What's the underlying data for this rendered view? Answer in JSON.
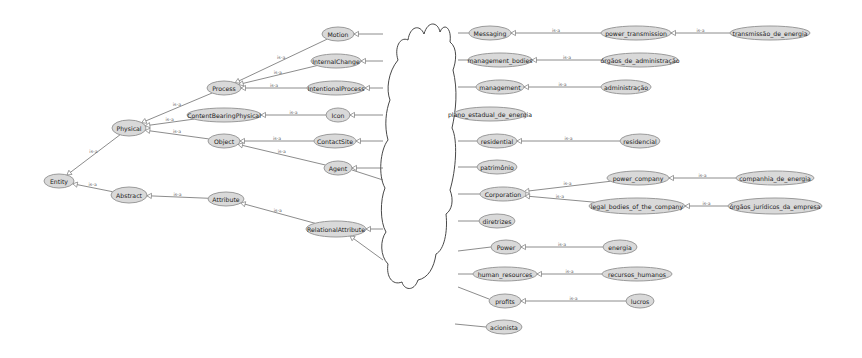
{
  "diagram": {
    "title": "",
    "edge_label": "is-a",
    "colors": {
      "node_fill": "#d9d9d9",
      "node_stroke": "#9a9a9a",
      "edge": "#6e6e6e",
      "background": "#ffffff"
    },
    "nodes": [
      {
        "id": "Entity",
        "label": "Entity",
        "x": 59,
        "y": 181,
        "rx": 15,
        "ry": 7
      },
      {
        "id": "Physical",
        "label": "Physical",
        "x": 129,
        "y": 128,
        "rx": 17,
        "ry": 8
      },
      {
        "id": "Abstract",
        "label": "Abstract",
        "x": 129,
        "y": 195,
        "rx": 18,
        "ry": 8
      },
      {
        "id": "Process",
        "label": "Process",
        "x": 224,
        "y": 88,
        "rx": 17,
        "ry": 7
      },
      {
        "id": "ContentBearingPhysical",
        "label": "ContentBearingPhysical",
        "x": 224,
        "y": 115,
        "rx": 37,
        "ry": 7
      },
      {
        "id": "Object",
        "label": "Object",
        "x": 224,
        "y": 141,
        "rx": 16,
        "ry": 7
      },
      {
        "id": "Attribute",
        "label": "Attribute",
        "x": 226,
        "y": 199,
        "rx": 18,
        "ry": 7
      },
      {
        "id": "Motion",
        "label": "Motion",
        "x": 338,
        "y": 34,
        "rx": 16,
        "ry": 7
      },
      {
        "id": "InternalChange",
        "label": "InternalChange",
        "x": 336,
        "y": 61,
        "rx": 25,
        "ry": 7
      },
      {
        "id": "IntentionalProcess",
        "label": "IntentionalProcess",
        "x": 336,
        "y": 88,
        "rx": 29,
        "ry": 7
      },
      {
        "id": "Icon",
        "label": "Icon",
        "x": 338,
        "y": 115,
        "rx": 12,
        "ry": 7
      },
      {
        "id": "ContactSite",
        "label": "ContactSite",
        "x": 335,
        "y": 141,
        "rx": 21,
        "ry": 7
      },
      {
        "id": "Agent",
        "label": "Agent",
        "x": 338,
        "y": 168,
        "rx": 14,
        "ry": 7
      },
      {
        "id": "RelationalAttribute",
        "label": "RelationalAttribute",
        "x": 336,
        "y": 229,
        "rx": 30,
        "ry": 8
      },
      {
        "id": "Messaging",
        "label": "Messaging",
        "x": 490,
        "y": 33,
        "rx": 21,
        "ry": 7
      },
      {
        "id": "management_bodies",
        "label": "management_bodies",
        "x": 500,
        "y": 60,
        "rx": 32,
        "ry": 7
      },
      {
        "id": "management",
        "label": "management",
        "x": 500,
        "y": 87,
        "rx": 24,
        "ry": 7
      },
      {
        "id": "plano_estadual_de_energia",
        "label": "plano_estadual_de_energia",
        "x": 490,
        "y": 114,
        "rx": 36,
        "ry": 7
      },
      {
        "id": "residential",
        "label": "residential",
        "x": 497,
        "y": 141,
        "rx": 20,
        "ry": 7
      },
      {
        "id": "patrimonio",
        "label": "patrimônio",
        "x": 497,
        "y": 167,
        "rx": 20,
        "ry": 7
      },
      {
        "id": "Corporation",
        "label": "Corporation",
        "x": 503,
        "y": 194,
        "rx": 23,
        "ry": 7
      },
      {
        "id": "diretrizes",
        "label": "diretrizes",
        "x": 497,
        "y": 221,
        "rx": 18,
        "ry": 7
      },
      {
        "id": "Power",
        "label": "Power",
        "x": 506,
        "y": 247,
        "rx": 15,
        "ry": 7
      },
      {
        "id": "human_resources",
        "label": "human_resources",
        "x": 505,
        "y": 274,
        "rx": 32,
        "ry": 7
      },
      {
        "id": "profits",
        "label": "profits",
        "x": 505,
        "y": 301,
        "rx": 16,
        "ry": 7
      },
      {
        "id": "acionista",
        "label": "acionista",
        "x": 504,
        "y": 327,
        "rx": 18,
        "ry": 7
      },
      {
        "id": "power_transmission",
        "label": "power_transmission",
        "x": 636,
        "y": 33,
        "rx": 35,
        "ry": 7
      },
      {
        "id": "orgaos_de_administracao",
        "label": "órgãos_de_administração",
        "x": 640,
        "y": 60,
        "rx": 38,
        "ry": 7
      },
      {
        "id": "administracao",
        "label": "administração",
        "x": 626,
        "y": 87,
        "rx": 25,
        "ry": 7
      },
      {
        "id": "residencial",
        "label": "residencial",
        "x": 640,
        "y": 141,
        "rx": 20,
        "ry": 7
      },
      {
        "id": "power_company",
        "label": "power_company",
        "x": 638,
        "y": 178,
        "rx": 31,
        "ry": 7
      },
      {
        "id": "legal_bodies_of_the_company",
        "label": "legal_bodies_of_the_company",
        "x": 637,
        "y": 206,
        "rx": 48,
        "ry": 8
      },
      {
        "id": "energia",
        "label": "energia",
        "x": 620,
        "y": 247,
        "rx": 17,
        "ry": 7
      },
      {
        "id": "recursos_humanos",
        "label": "recursos_humanos",
        "x": 637,
        "y": 274,
        "rx": 35,
        "ry": 7
      },
      {
        "id": "lucros",
        "label": "lucros",
        "x": 640,
        "y": 301,
        "rx": 14,
        "ry": 7
      },
      {
        "id": "transmissao_de_energia",
        "label": "transmissão_de_energia",
        "x": 770,
        "y": 33,
        "rx": 40,
        "ry": 7
      },
      {
        "id": "companhia_de_energia",
        "label": "companhia_de_energia",
        "x": 775,
        "y": 178,
        "rx": 39,
        "ry": 7
      },
      {
        "id": "orgaos_juridicos_da_empresa",
        "label": "órgãos_jurídicos_da_empresa",
        "x": 775,
        "y": 206,
        "rx": 47,
        "ry": 8
      }
    ],
    "edges": [
      {
        "from": "Physical",
        "to": "Entity",
        "label": "is-a"
      },
      {
        "from": "Abstract",
        "to": "Entity",
        "label": "is-a"
      },
      {
        "from": "Process",
        "to": "Physical",
        "label": "is-a"
      },
      {
        "from": "ContentBearingPhysical",
        "to": "Physical",
        "label": "is-a"
      },
      {
        "from": "Object",
        "to": "Physical",
        "label": "is-a"
      },
      {
        "from": "Attribute",
        "to": "Abstract",
        "label": "is-a"
      },
      {
        "from": "Motion",
        "to": "Process",
        "label": "is-a"
      },
      {
        "from": "InternalChange",
        "to": "Process",
        "label": "is-a"
      },
      {
        "from": "IntentionalProcess",
        "to": "Process",
        "label": "is-a"
      },
      {
        "from": "Icon",
        "to": "ContentBearingPhysical",
        "label": "is-a"
      },
      {
        "from": "ContactSite",
        "to": "Object",
        "label": "is-a"
      },
      {
        "from": "Agent",
        "to": "Object",
        "label": "is-a"
      },
      {
        "from": "RelationalAttribute",
        "to": "Attribute",
        "label": "is-a"
      },
      {
        "from": "power_transmission",
        "to": "Messaging",
        "label": "is-a"
      },
      {
        "from": "orgaos_de_administracao",
        "to": "management_bodies",
        "label": "is-a"
      },
      {
        "from": "administracao",
        "to": "management",
        "label": "is-a"
      },
      {
        "from": "residencial",
        "to": "residential",
        "label": "is-a"
      },
      {
        "from": "power_company",
        "to": "Corporation",
        "label": "is-a"
      },
      {
        "from": "legal_bodies_of_the_company",
        "to": "Corporation",
        "label": "is-a"
      },
      {
        "from": "energia",
        "to": "Power",
        "label": "is-a"
      },
      {
        "from": "recursos_humanos",
        "to": "human_resources",
        "label": "is-a"
      },
      {
        "from": "lucros",
        "to": "profits",
        "label": "is-a"
      },
      {
        "from": "transmissao_de_energia",
        "to": "power_transmission",
        "label": "is-a"
      },
      {
        "from": "companhia_de_energia",
        "to": "power_company",
        "label": "is-a"
      },
      {
        "from": "orgaos_juridicos_da_empresa",
        "to": "legal_bodies_of_the_company",
        "label": "is-a"
      }
    ],
    "cloud_stubs_left": [
      {
        "x1": 354,
        "y1": 34,
        "x2": 383,
        "y2": 34,
        "arrow": true
      },
      {
        "x1": 361,
        "y1": 61,
        "x2": 383,
        "y2": 61,
        "arrow": true
      },
      {
        "x1": 365,
        "y1": 88,
        "x2": 383,
        "y2": 88,
        "arrow": true
      },
      {
        "x1": 350,
        "y1": 115,
        "x2": 383,
        "y2": 115,
        "arrow": true
      },
      {
        "x1": 356,
        "y1": 141,
        "x2": 383,
        "y2": 141,
        "arrow": true
      },
      {
        "x1": 352,
        "y1": 168,
        "x2": 383,
        "y2": 168,
        "arrow": true
      },
      {
        "x1": 352,
        "y1": 170,
        "x2": 383,
        "y2": 180,
        "arrow": false
      },
      {
        "x1": 366,
        "y1": 229,
        "x2": 383,
        "y2": 229,
        "arrow": true
      },
      {
        "x1": 350,
        "y1": 236,
        "x2": 383,
        "y2": 260,
        "arrow": true
      }
    ],
    "cloud_stubs_right": [
      {
        "x1": 458,
        "y1": 33,
        "x2": 469,
        "y2": 33
      },
      {
        "x1": 458,
        "y1": 60,
        "x2": 468,
        "y2": 60
      },
      {
        "x1": 458,
        "y1": 87,
        "x2": 476,
        "y2": 87
      },
      {
        "x1": 458,
        "y1": 141,
        "x2": 477,
        "y2": 141
      },
      {
        "x1": 458,
        "y1": 167,
        "x2": 477,
        "y2": 167
      },
      {
        "x1": 458,
        "y1": 194,
        "x2": 480,
        "y2": 194
      },
      {
        "x1": 458,
        "y1": 221,
        "x2": 479,
        "y2": 221
      },
      {
        "x1": 458,
        "y1": 251,
        "x2": 491,
        "y2": 247
      },
      {
        "x1": 458,
        "y1": 274,
        "x2": 473,
        "y2": 274
      },
      {
        "x1": 458,
        "y1": 287,
        "x2": 489,
        "y2": 299
      },
      {
        "x1": 455,
        "y1": 324,
        "x2": 486,
        "y2": 327
      }
    ]
  }
}
